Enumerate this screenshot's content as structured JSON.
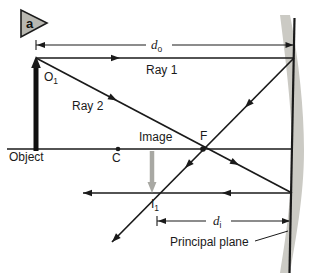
{
  "figure_label": "a",
  "diagram": {
    "dimension_do": {
      "symbol": "d",
      "subscript": "o"
    },
    "dimension_di": {
      "symbol": "d",
      "subscript": "i"
    },
    "ray1_label": "Ray 1",
    "ray2_label": "Ray 2",
    "object_point_label": {
      "symbol": "O",
      "subscript": "1"
    },
    "image_point_label": {
      "symbol": "I",
      "subscript": "1"
    },
    "object_label": "Object",
    "image_label": "Image",
    "center_of_curvature_label": "C",
    "focal_point_label": "F",
    "principal_plane_label": "Principal plane"
  },
  "colors": {
    "ink": "#1a1a1a",
    "mirror_surface": "#cbcac4",
    "image_arrow": "#a8a8a3",
    "badge_fill": "#b8b7b0",
    "background": "#ffffff"
  }
}
